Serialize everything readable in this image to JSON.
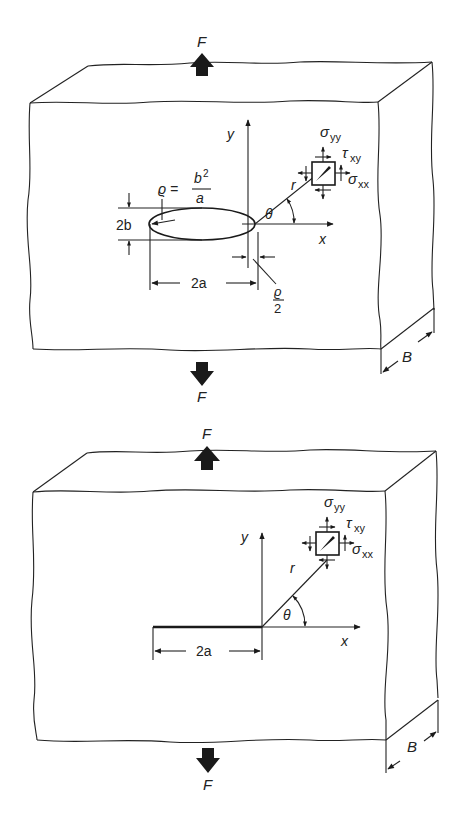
{
  "figures": [
    {
      "id": "elliptical-hole",
      "load_top_label": "F",
      "load_bottom_label": "F",
      "thickness_label": "B",
      "y_axis_label": "y",
      "x_axis_label": "x",
      "radius_label": "r",
      "angle_label": "θ",
      "stress_yy": {
        "symbol": "σ",
        "subscript": "yy"
      },
      "shear_xy": {
        "symbol": "τ",
        "subscript": "xy"
      },
      "stress_xx": {
        "symbol": "σ",
        "subscript": "xx"
      },
      "rho_equation": {
        "lhs": "ϱ =",
        "numerator": "b",
        "numerator_sup": "2",
        "denominator": "a"
      },
      "height_label": "2b",
      "length_label": "2a",
      "half_rho": {
        "numerator": "ϱ",
        "denominator": "2"
      }
    },
    {
      "id": "sharp-crack",
      "load_top_label": "F",
      "load_bottom_label": "F",
      "thickness_label": "B",
      "y_axis_label": "y",
      "x_axis_label": "x",
      "radius_label": "r",
      "angle_label": "θ",
      "stress_yy": {
        "symbol": "σ",
        "subscript": "yy"
      },
      "shear_xy": {
        "symbol": "τ",
        "subscript": "xy"
      },
      "stress_xx": {
        "symbol": "σ",
        "subscript": "xx"
      },
      "length_label": "2a"
    }
  ],
  "colors": {
    "ink": "#1a1a1a",
    "background": "#ffffff"
  }
}
